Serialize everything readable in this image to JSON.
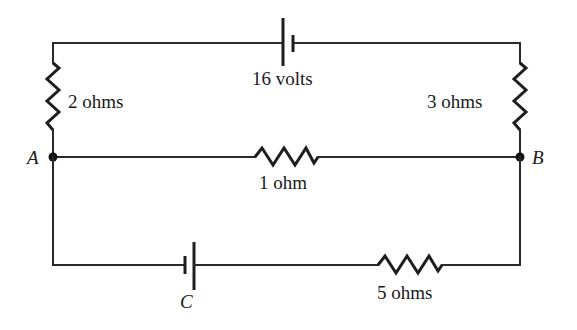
{
  "diagram": {
    "type": "electrical-circuit",
    "components": {
      "battery_top": {
        "label": "16 volts"
      },
      "resistor_left": {
        "label": "2 ohms"
      },
      "resistor_right": {
        "label": "3 ohms"
      },
      "resistor_middle": {
        "label": "1 ohm"
      },
      "resistor_bottom": {
        "label": "5 ohms"
      },
      "battery_bottom": {
        "label": "C"
      }
    },
    "nodes": {
      "a": {
        "label": "A"
      },
      "b": {
        "label": "B"
      }
    },
    "colors": {
      "line": "#1e1e1e",
      "background": "#ffffff"
    }
  }
}
